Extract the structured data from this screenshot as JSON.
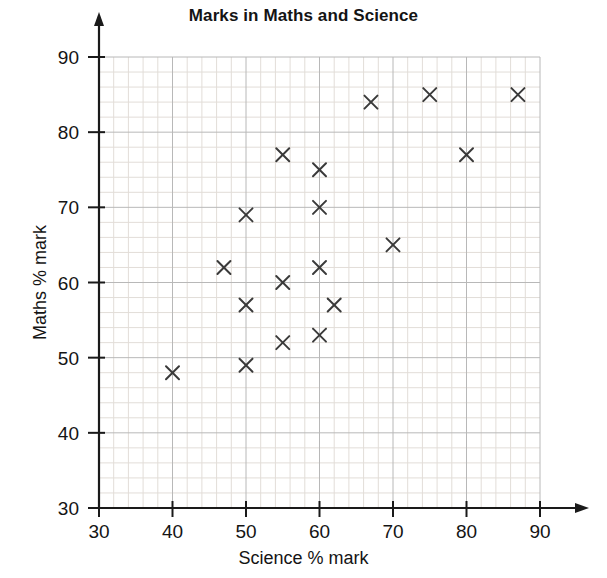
{
  "chart_data": {
    "type": "scatter",
    "title": "Marks in Maths and Science",
    "xlabel": "Science % mark",
    "ylabel": "Maths % mark",
    "xlim": [
      30,
      90
    ],
    "ylim": [
      30,
      90
    ],
    "xticks": [
      30,
      40,
      50,
      60,
      70,
      80,
      90
    ],
    "yticks": [
      30,
      40,
      50,
      60,
      70,
      80,
      90
    ],
    "grid": true,
    "grid_major_step": 10,
    "grid_minor_step": 2,
    "legend": null,
    "marker": "x",
    "marker_color": "#3a3a3a",
    "points": [
      {
        "x": 40,
        "y": 48
      },
      {
        "x": 47,
        "y": 62
      },
      {
        "x": 50,
        "y": 69
      },
      {
        "x": 50,
        "y": 57
      },
      {
        "x": 50,
        "y": 49
      },
      {
        "x": 55,
        "y": 77
      },
      {
        "x": 55,
        "y": 60
      },
      {
        "x": 55,
        "y": 52
      },
      {
        "x": 60,
        "y": 75
      },
      {
        "x": 60,
        "y": 70
      },
      {
        "x": 60,
        "y": 62
      },
      {
        "x": 60,
        "y": 53
      },
      {
        "x": 62,
        "y": 57
      },
      {
        "x": 67,
        "y": 84
      },
      {
        "x": 70,
        "y": 65
      },
      {
        "x": 75,
        "y": 85
      },
      {
        "x": 80,
        "y": 77
      },
      {
        "x": 87,
        "y": 85
      }
    ]
  },
  "colors": {
    "axis": "#1a1a1a",
    "grid_major": "#b8b8b8",
    "grid_minor": "#e2ddd8",
    "marker": "#3a3a3a",
    "background": "#ffffff"
  }
}
